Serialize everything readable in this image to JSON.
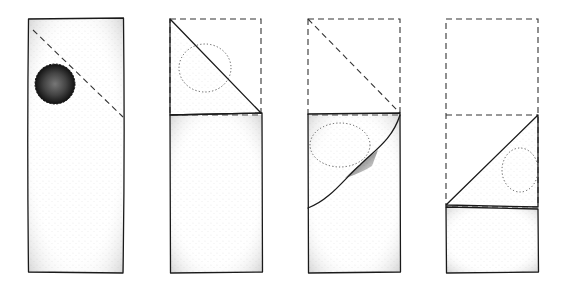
{
  "diagram": {
    "type": "folding-steps",
    "step_count": 4,
    "colors": {
      "ink": "#1a1a1a",
      "dash": "#333333",
      "background": "#ffffff"
    },
    "steps": [
      {
        "index": 1,
        "description": "Flat rectangular strip with a round spot near top-left; dashed diagonal fold line across top square"
      },
      {
        "index": 2,
        "description": "Top corner folded down along diagonal, forming triangle; dashed outline shows original top square"
      },
      {
        "index": 3,
        "description": "Triangle folded behind/down along curved edge; dashed outline of top square with diagonal"
      },
      {
        "index": 4,
        "description": "Strip folded up into lower section with triangular flap; dashed outline of removed top area"
      }
    ]
  }
}
